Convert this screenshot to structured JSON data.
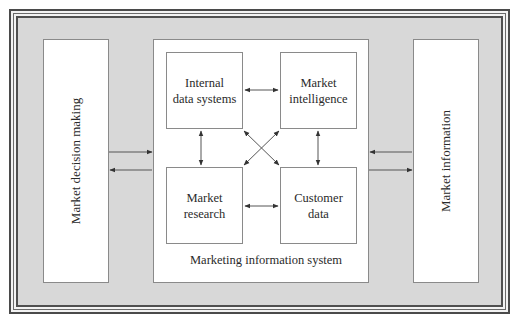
{
  "diagram": {
    "left_panel": {
      "label": "Market decision making"
    },
    "right_panel": {
      "label": "Market information"
    },
    "center_system": {
      "caption": "Marketing information system",
      "components": [
        {
          "id": "internal",
          "label_line1": "Internal",
          "label_line2": "data systems"
        },
        {
          "id": "intelligence",
          "label_line1": "Market",
          "label_line2": "intelligence"
        },
        {
          "id": "research",
          "label_line1": "Market",
          "label_line2": "research"
        },
        {
          "id": "customer",
          "label_line1": "Customer",
          "label_line2": "data"
        }
      ]
    },
    "connections": [
      {
        "from": "Market decision making",
        "to": "Marketing information system",
        "type": "bidirectional-pair"
      },
      {
        "from": "Market information",
        "to": "Marketing information system",
        "type": "bidirectional-pair"
      },
      {
        "from": "Internal data systems",
        "to": "Market intelligence",
        "type": "double-arrow"
      },
      {
        "from": "Internal data systems",
        "to": "Market research",
        "type": "double-arrow"
      },
      {
        "from": "Market intelligence",
        "to": "Customer data",
        "type": "double-arrow"
      },
      {
        "from": "Market research",
        "to": "Customer data",
        "type": "double-arrow"
      },
      {
        "from": "Internal data systems",
        "to": "Customer data",
        "type": "double-arrow"
      },
      {
        "from": "Market intelligence",
        "to": "Market research",
        "type": "double-arrow"
      }
    ],
    "colors": {
      "frame_fill": "#d8d8d8",
      "box_fill": "#ffffff",
      "border": "#4a4a4a",
      "arrow": "#3a3a3a"
    }
  }
}
